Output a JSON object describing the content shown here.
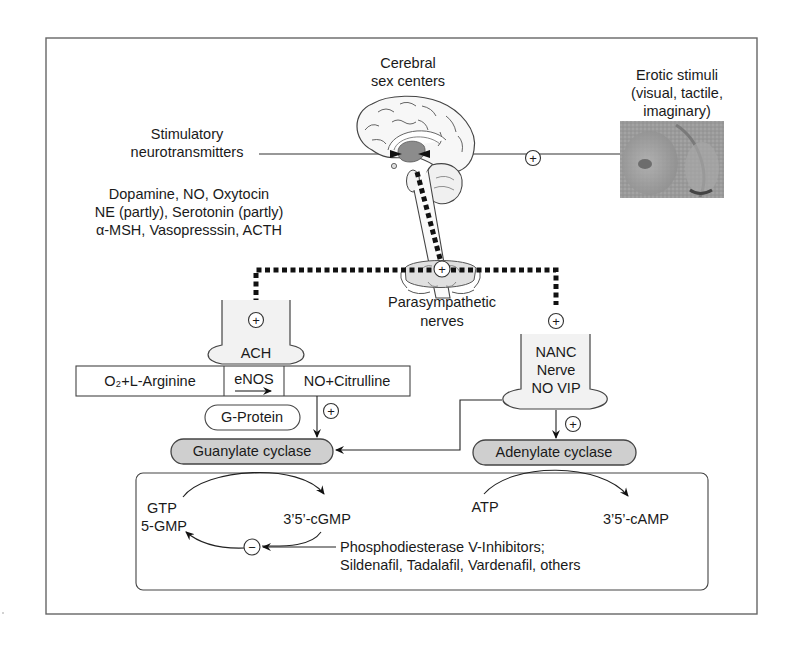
{
  "figure": {
    "title_labels": {
      "cerebral": [
        "Cerebral",
        "sex centers"
      ],
      "erotic": [
        "Erotic stimuli",
        "(visual, tactile,",
        "imaginary)"
      ],
      "stimulatory": [
        "Stimulatory",
        "neurotransmitters"
      ],
      "neurotransmitter_list": [
        "Dopamine, NO, Oxytocin",
        "NE (partly), Serotonin (partly)",
        "α-MSH, Vasopresssin, ACTH"
      ],
      "parasympathetic": [
        "Parasympathetic",
        "nerves"
      ]
    },
    "nodes": {
      "ach": "ACH",
      "nanc": [
        "NANC",
        "Nerve",
        "NO VIP"
      ],
      "substrate": "O₂+L-Arginine",
      "enzyme": "eNOS",
      "product": "NO+Citrulline",
      "g_protein": "G-Protein",
      "guanylate": "Guanylate cyclase",
      "adenylate": "Adenylate cyclase",
      "gtp": "GTP",
      "gmp5": "5-GMP",
      "cgmp": "3’5’-cGMP",
      "atp": "ATP",
      "camp": "3’5’-cAMP",
      "pde_inhibitors": [
        "Phosphodiesterase V-Inhibitors;",
        "Sildenafil, Tadalafil, Vardenafil, others"
      ]
    },
    "signs": {
      "plus": "+",
      "minus": "−"
    },
    "colors": {
      "enzyme_fill": "#cfcfcf",
      "line": "#333333",
      "dotted_pathway": "#111111"
    }
  }
}
